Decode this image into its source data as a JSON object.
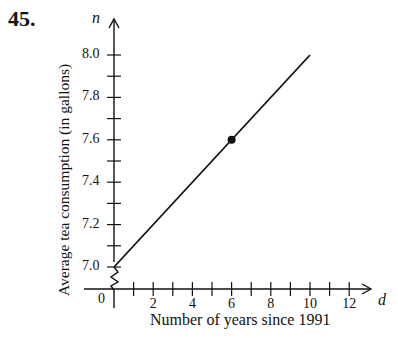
{
  "problem": {
    "number": "45."
  },
  "chart_data": {
    "type": "line",
    "title": "",
    "xlabel": "Number of years since 1991",
    "ylabel": "Average tea consumption (in gallons)",
    "x_variable": "d",
    "y_variable": "n",
    "xlim": [
      0,
      13
    ],
    "ylim": [
      7.0,
      8.1
    ],
    "x_tick_labels": [
      "0",
      "2",
      "4",
      "6",
      "8",
      "10",
      "12"
    ],
    "y_tick_labels": [
      "7.0",
      "7.2",
      "7.4",
      "7.6",
      "7.8",
      "8.0"
    ],
    "y_axis_break": true,
    "grid": false,
    "series": [
      {
        "name": "tea consumption",
        "x": [
          0,
          10
        ],
        "y": [
          7.0,
          8.0
        ]
      }
    ],
    "highlighted_points": [
      {
        "x": 6,
        "y": 7.6
      }
    ]
  }
}
